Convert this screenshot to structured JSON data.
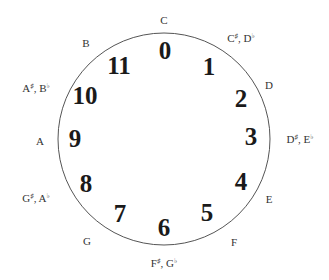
{
  "diagram": {
    "type": "pitch-class-clock",
    "circle": {
      "cx": 164,
      "cy": 139,
      "r": 106,
      "stroke": "#555555"
    },
    "pitch_classes": [
      {
        "number": "0",
        "x": 165,
        "y": 50,
        "note": "C",
        "note_sup": "",
        "note2": "",
        "note2_sup": "",
        "nx": 164,
        "ny": 20
      },
      {
        "number": "1",
        "x": 209,
        "y": 66,
        "note": "C",
        "note_sup": "♯",
        "note2": "D",
        "note2_sup": "♭",
        "nx": 241,
        "ny": 38
      },
      {
        "number": "2",
        "x": 241,
        "y": 98,
        "note": "D",
        "note_sup": "",
        "note2": "",
        "note2_sup": "",
        "nx": 269,
        "ny": 85
      },
      {
        "number": "3",
        "x": 251,
        "y": 136,
        "note": "D",
        "note_sup": "♯",
        "note2": "E",
        "note2_sup": "♭",
        "nx": 300,
        "ny": 139
      },
      {
        "number": "4",
        "x": 241,
        "y": 181,
        "note": "E",
        "note_sup": "",
        "note2": "",
        "note2_sup": "",
        "nx": 269,
        "ny": 199
      },
      {
        "number": "5",
        "x": 207,
        "y": 212,
        "note": "F",
        "note_sup": "",
        "note2": "",
        "note2_sup": "",
        "nx": 234,
        "ny": 242
      },
      {
        "number": "6",
        "x": 164,
        "y": 227,
        "note": "F",
        "note_sup": "♯",
        "note2": "G",
        "note2_sup": "♭",
        "nx": 164,
        "ny": 263
      },
      {
        "number": "7",
        "x": 120,
        "y": 213,
        "note": "G",
        "note_sup": "",
        "note2": "",
        "note2_sup": "",
        "nx": 87,
        "ny": 241
      },
      {
        "number": "8",
        "x": 86,
        "y": 183,
        "note": "G",
        "note_sup": "♯",
        "note2": "A",
        "note2_sup": "♭",
        "nx": 36,
        "ny": 198
      },
      {
        "number": "9",
        "x": 75,
        "y": 138,
        "note": "A",
        "note_sup": "",
        "note2": "",
        "note2_sup": "",
        "nx": 40,
        "ny": 141
      },
      {
        "number": "10",
        "x": 85,
        "y": 95,
        "note": "A",
        "note_sup": "♯",
        "note2": "B",
        "note2_sup": "♭",
        "nx": 36,
        "ny": 88
      },
      {
        "number": "11",
        "x": 119,
        "y": 65,
        "note": "B",
        "note_sup": "",
        "note2": "",
        "note2_sup": "",
        "nx": 86,
        "ny": 43
      }
    ]
  }
}
